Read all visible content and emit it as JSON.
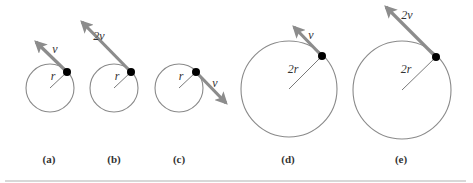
{
  "figure": {
    "panels": [
      {
        "id": "a",
        "caption": "(a)",
        "radius_label": "r",
        "velocity_label": "v",
        "center": [
          50,
          88
        ],
        "radius": 24,
        "particle": [
          67,
          72
        ],
        "arrow_tip": [
          36,
          42
        ],
        "radius_label_pos": [
          53,
          80
        ],
        "velocity_label_pos": [
          55,
          53
        ],
        "caption_pos": [
          49,
          163
        ]
      },
      {
        "id": "b",
        "caption": "(b)",
        "radius_label": "r",
        "velocity_label": "2v",
        "center": [
          114,
          88
        ],
        "radius": 24,
        "particle": [
          131,
          72
        ],
        "arrow_tip": [
          82,
          22
        ],
        "radius_label_pos": [
          117,
          80
        ],
        "velocity_label_pos": [
          99,
          40
        ],
        "caption_pos": [
          114,
          163
        ]
      },
      {
        "id": "c",
        "caption": "(c)",
        "radius_label": "r",
        "velocity_label": "v",
        "center": [
          179,
          88
        ],
        "radius": 24,
        "particle": [
          196,
          72
        ],
        "arrow_tip": [
          226,
          103
        ],
        "radius_label_pos": [
          181,
          80
        ],
        "velocity_label_pos": [
          215,
          87
        ],
        "caption_pos": [
          179,
          163
        ]
      },
      {
        "id": "d",
        "caption": "(d)",
        "radius_label": "2r",
        "velocity_label": "v",
        "center": [
          289,
          89
        ],
        "radius": 48,
        "particle": [
          322,
          56
        ],
        "arrow_tip": [
          294,
          27
        ],
        "radius_label_pos": [
          293,
          73
        ],
        "velocity_label_pos": [
          311,
          39
        ],
        "caption_pos": [
          288,
          163
        ]
      },
      {
        "id": "e",
        "caption": "(e)",
        "radius_label": "2r",
        "velocity_label": "2v",
        "center": [
          402,
          90
        ],
        "radius": 49,
        "particle": [
          436,
          57
        ],
        "arrow_tip": [
          386,
          7
        ],
        "radius_label_pos": [
          406,
          73
        ],
        "velocity_label_pos": [
          407,
          19
        ],
        "caption_pos": [
          401,
          163
        ]
      }
    ],
    "colors": {
      "circle": "#8a8a8a",
      "velocity_arrow": "#8c8c8c",
      "particle": "#000000",
      "text": "#333333",
      "rule": "#d8d8d8"
    }
  }
}
